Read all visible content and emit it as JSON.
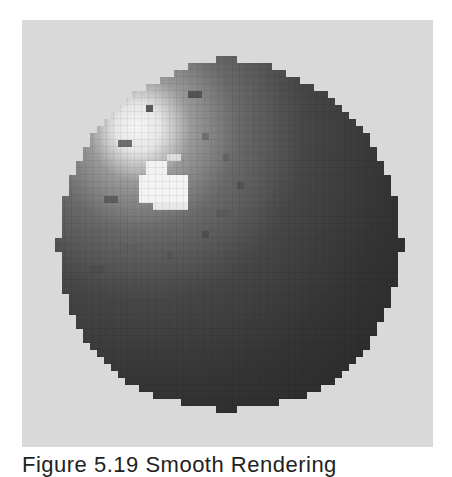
{
  "figure": {
    "caption": "Figure 5.19 Smooth Rendering",
    "colors": {
      "background_panel": "#d9d9d9",
      "page": "#ffffff",
      "sphere_dark": "#2e2e2e",
      "sphere_mid": "#5a5a5a",
      "highlight": "#f4f4f4"
    },
    "sphere": {
      "center_x": 205,
      "center_y": 222,
      "radius": 175,
      "highlight_x": 145,
      "highlight_y": 155
    }
  }
}
